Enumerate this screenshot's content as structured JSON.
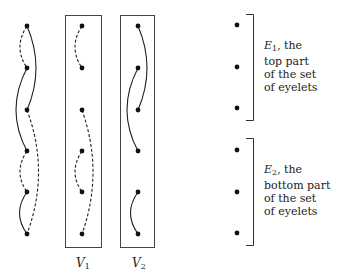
{
  "figure": {
    "columns": [
      {
        "name": "full-eyelet-column",
        "x": 27,
        "dots_y": [
          26,
          68,
          110,
          151,
          192,
          234
        ],
        "arcs": [
          {
            "from": 1,
            "to": 2,
            "style": "dashed",
            "bow": "left"
          },
          {
            "from": 1,
            "to": 3,
            "style": "solid",
            "bow": "right"
          },
          {
            "from": 2,
            "to": 4,
            "style": "solid",
            "bow": "left"
          },
          {
            "from": 3,
            "to": 6,
            "style": "dashed",
            "bow": "right"
          },
          {
            "from": 4,
            "to": 5,
            "style": "dashed",
            "bow": "left"
          },
          {
            "from": 5,
            "to": 6,
            "style": "solid",
            "bow": "left"
          }
        ]
      },
      {
        "name": "V1",
        "x": 82,
        "dots_y": [
          26,
          68,
          110,
          151,
          192,
          234
        ],
        "arcs": [
          {
            "from": 1,
            "to": 2,
            "style": "dashed",
            "bow": "left"
          },
          {
            "from": 3,
            "to": 6,
            "style": "dashed",
            "bow": "right"
          },
          {
            "from": 4,
            "to": 5,
            "style": "dashed",
            "bow": "left"
          }
        ]
      },
      {
        "name": "V2",
        "x": 138,
        "dots_y": [
          26,
          68,
          110,
          151,
          192,
          234
        ],
        "arcs": [
          {
            "from": 1,
            "to": 3,
            "style": "solid",
            "bow": "right"
          },
          {
            "from": 2,
            "to": 4,
            "style": "solid",
            "bow": "left"
          },
          {
            "from": 5,
            "to": 6,
            "style": "solid",
            "bow": "left"
          }
        ]
      }
    ],
    "box_labels": {
      "v1": {
        "main": "V",
        "sub": "1"
      },
      "v2": {
        "main": "V",
        "sub": "2"
      }
    },
    "eyelet_groups": [
      {
        "symbol": "E",
        "sub": "1",
        "text_line1": ", the",
        "text_line2": "top part",
        "text_line3": "of the set",
        "text_line4": "of eyelets"
      },
      {
        "symbol": "E",
        "sub": "2",
        "text_line1": ", the",
        "text_line2": "bottom part",
        "text_line3": "of the set",
        "text_line4": "of eyelets"
      }
    ]
  }
}
